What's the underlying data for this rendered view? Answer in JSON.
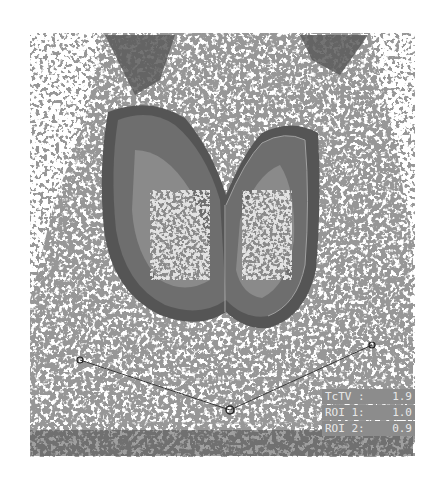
{
  "image": {
    "description": "Grayscale thyroid scintigraphy scan with ROI overlay lines",
    "colors": {
      "background": "#ffffff",
      "speckle": "#505050",
      "lobe_outer": "#6e6e6e",
      "lobe_inner": "#8a8a8a",
      "lobe_hot": "#b4b4b4",
      "overlay_line": "#9a9a9a",
      "label_bg": "#8c8c8c",
      "label_text": "#e8e8e8"
    }
  },
  "measurements": [
    {
      "label": "TcTV :",
      "value": "1.9"
    },
    {
      "label": "ROI 1:",
      "value": "1.0"
    },
    {
      "label": "ROI 2:",
      "value": "0.9"
    }
  ],
  "markers": [
    {
      "name": "left-marker",
      "x": 80,
      "y": 360
    },
    {
      "name": "center-marker",
      "x": 230,
      "y": 410
    },
    {
      "name": "right-marker",
      "x": 372,
      "y": 345
    }
  ]
}
